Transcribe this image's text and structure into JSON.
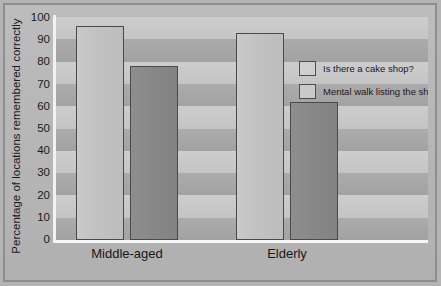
{
  "chart_data": {
    "type": "bar",
    "title": "",
    "xlabel": "",
    "ylabel": "Percentage of locations remembered correctly",
    "categories": [
      "Middle-aged",
      "Elderly"
    ],
    "series": [
      {
        "name": "Is there a cake shop?",
        "values": [
          96,
          93
        ]
      },
      {
        "name": "Mental walk listing the shops",
        "values": [
          78,
          62
        ]
      }
    ],
    "ylim": [
      0,
      100
    ],
    "yticks": [
      100,
      90,
      80,
      70,
      60,
      50,
      40,
      30,
      20,
      10,
      0
    ],
    "ytick_labels": [
      "100",
      "90",
      "80",
      "70",
      "60",
      "50",
      "40",
      "30",
      "20",
      "10",
      "0"
    ],
    "grid": "horizontal-bands",
    "legend_position": "inside-top-right",
    "colors": {
      "series_0": "#c2c2c2",
      "series_1": "#888888",
      "bar_border": "#4a4a4a",
      "band_light": "#c9c9c9",
      "band_dark": "#a6a6a6",
      "figure_background": "#b4b4b4",
      "frame_border": "#8e8e8e",
      "axis_line": "#f4f4f4",
      "text": "#1b1b1b"
    }
  }
}
